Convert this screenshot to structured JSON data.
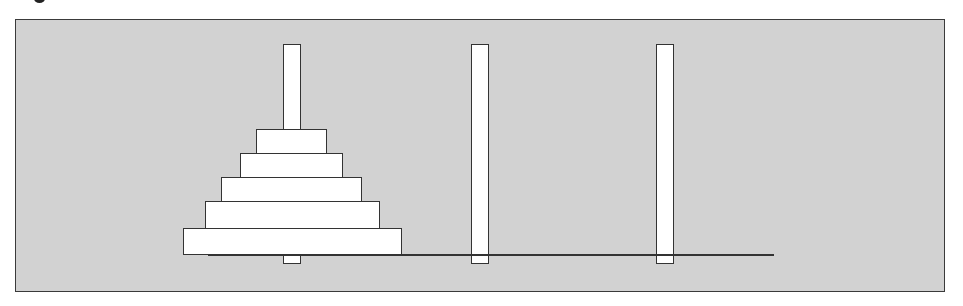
{
  "diagram": {
    "colors": {
      "background": "#d2d2d2",
      "frame_border": "#3a3a3a",
      "piece_fill": "#ffffff",
      "outline": "#333333"
    },
    "pegs": [
      {
        "id": "A",
        "x": 283,
        "top": 44,
        "bottom": 264,
        "width": 18
      },
      {
        "id": "B",
        "x": 471,
        "top": 44,
        "bottom": 264,
        "width": 18
      },
      {
        "id": "C",
        "x": 656,
        "top": 44,
        "bottom": 264,
        "width": 18
      }
    ],
    "base": {
      "x1": 208,
      "x2": 774,
      "y": 254
    },
    "disks": [
      {
        "peg": "A",
        "size": 1,
        "left": 256,
        "top": 129,
        "width": 71,
        "height": 25
      },
      {
        "peg": "A",
        "size": 2,
        "left": 240,
        "top": 153,
        "width": 103,
        "height": 25
      },
      {
        "peg": "A",
        "size": 3,
        "left": 221,
        "top": 177,
        "width": 141,
        "height": 25
      },
      {
        "peg": "A",
        "size": 4,
        "left": 205,
        "top": 201,
        "width": 175,
        "height": 28
      },
      {
        "peg": "A",
        "size": 5,
        "left": 183,
        "top": 228,
        "width": 219,
        "height": 27
      }
    ],
    "disk_count": 5
  }
}
